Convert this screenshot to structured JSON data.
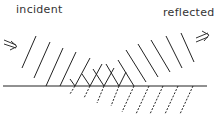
{
  "diagram": {
    "labels": {
      "incident": "incident",
      "reflected": "reflected"
    },
    "colors": {
      "line": "#222222",
      "background": "#ffffff"
    },
    "boundary": {
      "x1": 3,
      "x2": 207,
      "y": 86
    },
    "incident_wavefronts": [
      {
        "x1": 22,
        "y1": 68,
        "x2": 36,
        "y2": 36
      },
      {
        "x1": 34,
        "y1": 78,
        "x2": 50,
        "y2": 42
      },
      {
        "x1": 46,
        "y1": 86,
        "x2": 63,
        "y2": 48
      },
      {
        "x1": 60,
        "y1": 86,
        "x2": 76,
        "y2": 52
      },
      {
        "x1": 75,
        "y1": 86,
        "x2": 90,
        "y2": 58
      },
      {
        "x1": 90,
        "y1": 86,
        "x2": 102,
        "y2": 64
      },
      {
        "x1": 104,
        "y1": 86,
        "x2": 114,
        "y2": 68
      },
      {
        "x1": 119,
        "y1": 86,
        "x2": 126,
        "y2": 72
      }
    ],
    "reflected_wavefronts": [
      {
        "x1": 75,
        "y1": 86,
        "x2": 70,
        "y2": 79
      },
      {
        "x1": 90,
        "y1": 86,
        "x2": 82,
        "y2": 74
      },
      {
        "x1": 104,
        "y1": 86,
        "x2": 93,
        "y2": 69
      },
      {
        "x1": 119,
        "y1": 86,
        "x2": 106,
        "y2": 64
      },
      {
        "x1": 134,
        "y1": 86,
        "x2": 118,
        "y2": 60
      },
      {
        "x1": 146,
        "y1": 82,
        "x2": 126,
        "y2": 50
      },
      {
        "x1": 158,
        "y1": 77,
        "x2": 138,
        "y2": 44
      },
      {
        "x1": 170,
        "y1": 72,
        "x2": 151,
        "y2": 40
      },
      {
        "x1": 182,
        "y1": 68,
        "x2": 166,
        "y2": 36
      },
      {
        "x1": 194,
        "y1": 62,
        "x2": 181,
        "y2": 33
      }
    ],
    "refracted_wavefronts": [
      {
        "x1": 75,
        "y1": 86,
        "x2": 70,
        "y2": 94
      },
      {
        "x1": 90,
        "y1": 86,
        "x2": 84,
        "y2": 98
      },
      {
        "x1": 104,
        "y1": 86,
        "x2": 97,
        "y2": 103
      },
      {
        "x1": 119,
        "y1": 86,
        "x2": 111,
        "y2": 106
      },
      {
        "x1": 134,
        "y1": 86,
        "x2": 122,
        "y2": 112
      },
      {
        "x1": 149,
        "y1": 86,
        "x2": 136,
        "y2": 114
      },
      {
        "x1": 163,
        "y1": 86,
        "x2": 150,
        "y2": 114
      },
      {
        "x1": 178,
        "y1": 86,
        "x2": 165,
        "y2": 114
      },
      {
        "x1": 193,
        "y1": 86,
        "x2": 180,
        "y2": 114
      }
    ],
    "arrows": {
      "incident": {
        "x": 4,
        "y": 44,
        "direction": "down-right"
      },
      "reflected": {
        "x": 196,
        "y": 38,
        "direction": "up-right"
      }
    }
  }
}
